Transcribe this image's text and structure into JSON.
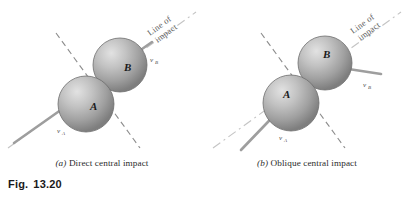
{
  "figure": {
    "number_prefix": "Fig.",
    "number": "13.20"
  },
  "panels": [
    {
      "id": "a",
      "marker": "(a)",
      "caption_text": "Direct central impact",
      "caption_full": "(a) Direct central impact",
      "line_of_impact_label_line1": "Line of",
      "line_of_impact_label_line2": "impact",
      "spheres": [
        {
          "name": "A",
          "label": "A"
        },
        {
          "name": "B",
          "label": "B"
        }
      ],
      "velocities": [
        {
          "name": "v_A",
          "symbol": "v",
          "subscript": "A"
        },
        {
          "name": "v_B",
          "symbol": "v",
          "subscript": "B"
        }
      ]
    },
    {
      "id": "b",
      "marker": "(b)",
      "caption_text": "Oblique central impact",
      "caption_full": "(b) Oblique central impact",
      "line_of_impact_label_line1": "Line of",
      "line_of_impact_label_line2": "impact",
      "spheres": [
        {
          "name": "A",
          "label": "A"
        },
        {
          "name": "B",
          "label": "B"
        }
      ],
      "velocities": [
        {
          "name": "v_A",
          "symbol": "v",
          "subscript": "A"
        },
        {
          "name": "v_B",
          "symbol": "v",
          "subscript": "B"
        }
      ]
    }
  ],
  "colors": {
    "background": "#ffffff",
    "sphere_light": "#d8d8d8",
    "sphere_mid": "#a8a8a8",
    "sphere_dark": "#7c7c7c",
    "sphere_edge": "#6e6e6e",
    "arrow": "#9a9a9a",
    "arrow_dark": "#7a7a7a",
    "dashed_line": "#8c8c8c",
    "impact_axis": "#b5b5b5",
    "text": "#2b2b2b",
    "fig_label_text": "#1a1a1a"
  }
}
